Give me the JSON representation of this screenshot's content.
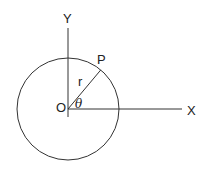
{
  "diagram": {
    "labels": {
      "y_axis": "Y",
      "x_axis": "X",
      "origin": "O",
      "point": "P",
      "radius": "r",
      "angle": "θ"
    },
    "angle_degrees": 50,
    "elements": [
      "circle",
      "x-axis",
      "y-axis",
      "radius-segment"
    ]
  }
}
